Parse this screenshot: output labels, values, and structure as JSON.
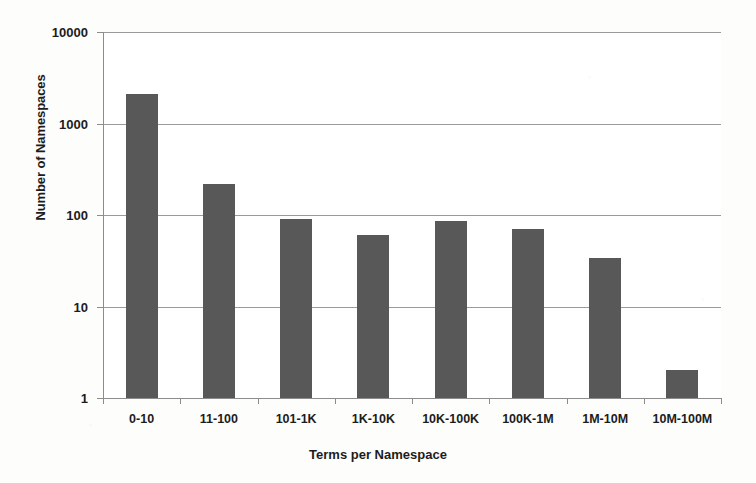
{
  "chart_data": {
    "type": "bar",
    "title": "",
    "subtitle": "",
    "xlabel": "Terms per Namespace",
    "ylabel": "Number of Namespaces",
    "categories": [
      "0-10",
      "11-100",
      "101-1K",
      "1K-10K",
      "10K-100K",
      "100K-1M",
      "1M-10M",
      "10M-100M"
    ],
    "values": [
      2100,
      220,
      90,
      60,
      86,
      70,
      34,
      2
    ],
    "series": [
      {
        "name": "Number of Namespaces",
        "values": [
          2100,
          220,
          90,
          60,
          86,
          70,
          34,
          2
        ]
      }
    ],
    "yscale": "log",
    "ylim": [
      1,
      10000
    ],
    "ytick_labels": [
      "1",
      "10",
      "100",
      "1000",
      "10000"
    ],
    "ytick_values": [
      1,
      10,
      100,
      1000,
      10000
    ],
    "grid": "horizontal",
    "legend": "none",
    "bar_color": "#585858",
    "axis_color": "#8c8c8c",
    "grid_color": "#9a9a9a",
    "text_color": "#1c1c1c",
    "background_color": "#ffffff"
  }
}
